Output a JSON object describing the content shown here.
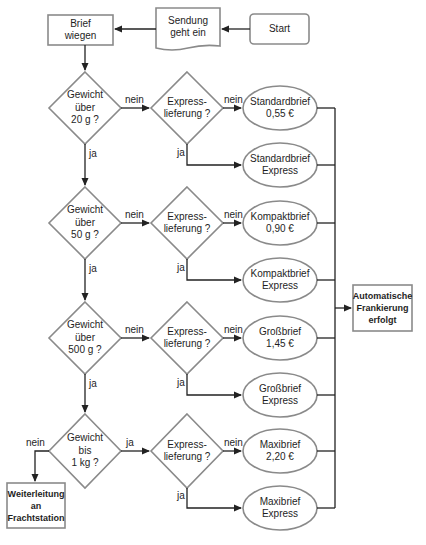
{
  "nodes": {
    "start": "Start",
    "sendung": "Sendung\ngeht ein",
    "wiegen": "Brief\nwiegen",
    "gew20": "Gewicht\nüber\n20 g ?",
    "gew50": "Gewicht\nüber\n50 g ?",
    "gew500": "Gewicht\nüber\n500 g ?",
    "gew1kg": "Gewicht\nbis\n1 kg ?",
    "express1": "Express-\nlieferung ?",
    "express2": "Express-\nlieferung ?",
    "express3": "Express-\nlieferung ?",
    "express4": "Express-\nlieferung ?",
    "standard": "Standardbrief\n0,55 €",
    "standard_express": "Standardbrief\nExpress",
    "kompakt": "Kompaktbrief\n0,90 €",
    "kompakt_express": "Kompaktbrief\nExpress",
    "gross": "Großbrief\n1,45 €",
    "gross_express": "Großbrief\nExpress",
    "maxi": "Maxibrief\n2,20 €",
    "maxi_express": "Maxibrief\nExpress",
    "auto": "Automatische\nFrankierung\nerfolgt",
    "fracht": "Weiterleitung\nan\nFrachtstation"
  },
  "edges": {
    "nein": "nein",
    "ja": "ja"
  },
  "colors": {
    "shape_stroke": "#8a8a8a",
    "line": "#222222"
  }
}
